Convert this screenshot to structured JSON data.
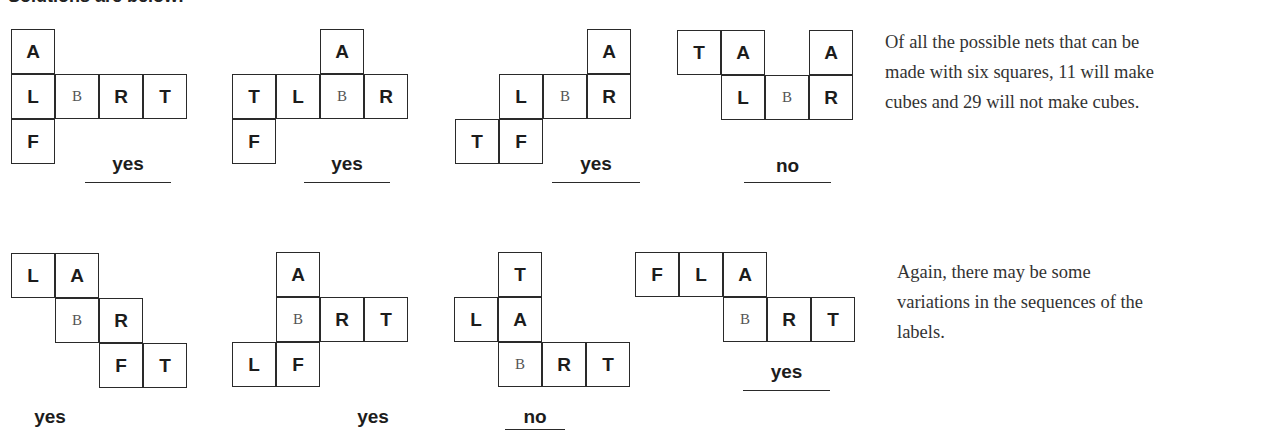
{
  "heading": "Solutions are below:",
  "cell_size": [
    44,
    45
  ],
  "nets": [
    {
      "id": "net-1",
      "origin": [
        11,
        29
      ],
      "cells": [
        {
          "c": 0,
          "r": 0,
          "label": "A"
        },
        {
          "c": 0,
          "r": 1,
          "label": "L"
        },
        {
          "c": 1,
          "r": 1,
          "label": "B",
          "serif": true
        },
        {
          "c": 2,
          "r": 1,
          "label": "R"
        },
        {
          "c": 3,
          "r": 1,
          "label": "T"
        },
        {
          "c": 0,
          "r": 2,
          "label": "F"
        }
      ],
      "verdict": {
        "label": "yes",
        "x": 85,
        "y": 153,
        "w": 86,
        "underline_y": 182
      }
    },
    {
      "id": "net-2",
      "origin": [
        232,
        29
      ],
      "cells": [
        {
          "c": 2,
          "r": 0,
          "label": "A"
        },
        {
          "c": 0,
          "r": 1,
          "label": "T"
        },
        {
          "c": 1,
          "r": 1,
          "label": "L"
        },
        {
          "c": 2,
          "r": 1,
          "label": "B",
          "serif": true
        },
        {
          "c": 3,
          "r": 1,
          "label": "R"
        },
        {
          "c": 0,
          "r": 2,
          "label": "F"
        }
      ],
      "verdict": {
        "label": "yes",
        "x": 304,
        "y": 153,
        "w": 86,
        "underline_y": 182
      }
    },
    {
      "id": "net-3",
      "origin": [
        455,
        29
      ],
      "cells": [
        {
          "c": 3,
          "r": 0,
          "label": "A"
        },
        {
          "c": 1,
          "r": 1,
          "label": "L"
        },
        {
          "c": 2,
          "r": 1,
          "label": "B",
          "serif": true
        },
        {
          "c": 3,
          "r": 1,
          "label": "R"
        },
        {
          "c": 0,
          "r": 2,
          "label": "T"
        },
        {
          "c": 1,
          "r": 2,
          "label": "F"
        }
      ],
      "verdict": {
        "label": "yes",
        "x": 552,
        "y": 153,
        "w": 88,
        "underline_y": 182
      }
    },
    {
      "id": "net-4",
      "origin": [
        677,
        30
      ],
      "cells": [
        {
          "c": 0,
          "r": 0,
          "label": "T"
        },
        {
          "c": 1,
          "r": 0,
          "label": "A"
        },
        {
          "c": 3,
          "r": 0,
          "label": "A"
        },
        {
          "c": 1,
          "r": 1,
          "label": "L"
        },
        {
          "c": 2,
          "r": 1,
          "label": "B",
          "serif": true
        },
        {
          "c": 3,
          "r": 1,
          "label": "R"
        }
      ],
      "verdict": {
        "label": "no",
        "x": 744,
        "y": 155,
        "w": 87,
        "underline_y": 182
      }
    },
    {
      "id": "net-5",
      "origin": [
        11,
        253
      ],
      "cells": [
        {
          "c": 0,
          "r": 0,
          "label": "L"
        },
        {
          "c": 1,
          "r": 0,
          "label": "A"
        },
        {
          "c": 1,
          "r": 1,
          "label": "B",
          "serif": true
        },
        {
          "c": 2,
          "r": 1,
          "label": "R"
        },
        {
          "c": 2,
          "r": 2,
          "label": "F"
        },
        {
          "c": 3,
          "r": 2,
          "label": "T"
        }
      ],
      "verdict": {
        "label": "yes",
        "x": 20,
        "y": 406,
        "w": 60,
        "underline_y": null
      }
    },
    {
      "id": "net-6",
      "origin": [
        232,
        252
      ],
      "cells": [
        {
          "c": 1,
          "r": 0,
          "label": "A"
        },
        {
          "c": 1,
          "r": 1,
          "label": "B",
          "serif": true
        },
        {
          "c": 2,
          "r": 1,
          "label": "R"
        },
        {
          "c": 3,
          "r": 1,
          "label": "T"
        },
        {
          "c": 0,
          "r": 2,
          "label": "L"
        },
        {
          "c": 1,
          "r": 2,
          "label": "F"
        }
      ],
      "verdict": {
        "label": "yes",
        "x": 343,
        "y": 406,
        "w": 60,
        "underline_y": null
      }
    },
    {
      "id": "net-7",
      "origin": [
        454,
        252
      ],
      "cells": [
        {
          "c": 1,
          "r": 0,
          "label": "T"
        },
        {
          "c": 0,
          "r": 1,
          "label": "L"
        },
        {
          "c": 1,
          "r": 1,
          "label": "A"
        },
        {
          "c": 1,
          "r": 2,
          "label": "B",
          "serif": true
        },
        {
          "c": 2,
          "r": 2,
          "label": "R"
        },
        {
          "c": 3,
          "r": 2,
          "label": "T"
        }
      ],
      "verdict": {
        "label": "no",
        "x": 505,
        "y": 406,
        "w": 60,
        "underline_y": 429
      }
    },
    {
      "id": "net-8",
      "origin": [
        635,
        252
      ],
      "cells": [
        {
          "c": 0,
          "r": 0,
          "label": "F"
        },
        {
          "c": 1,
          "r": 0,
          "label": "L"
        },
        {
          "c": 2,
          "r": 0,
          "label": "A"
        },
        {
          "c": 2,
          "r": 1,
          "label": "B",
          "serif": true
        },
        {
          "c": 3,
          "r": 1,
          "label": "R"
        },
        {
          "c": 4,
          "r": 1,
          "label": "T"
        }
      ],
      "verdict": {
        "label": "yes",
        "x": 743,
        "y": 361,
        "w": 87,
        "underline_y": 390
      }
    }
  ],
  "paragraphs": [
    {
      "id": "nets-count-note",
      "x": 885,
      "y": 27,
      "lines": [
        "Of all the possible nets that can be",
        "made with six squares, 11 will make",
        "cubes and 29 will not make cubes."
      ]
    },
    {
      "id": "variations-note",
      "x": 897,
      "y": 257,
      "lines": [
        "Again, there may be some",
        "variations in the sequences of the",
        "labels."
      ]
    }
  ]
}
